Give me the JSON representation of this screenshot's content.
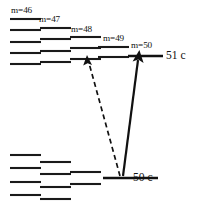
{
  "figure": {
    "type": "energy-level-diagram",
    "width": 197,
    "height": 206,
    "background": "#ffffff",
    "ink_color": "#111111"
  },
  "manifold_labels": [
    {
      "text": "m=46",
      "x": 11,
      "y": 6
    },
    {
      "text": "m=47",
      "x": 39,
      "y": 15
    },
    {
      "text": "m=48",
      "x": 71,
      "y": 25
    },
    {
      "text": "m=49",
      "x": 103,
      "y": 34
    },
    {
      "text": "m=50",
      "x": 131,
      "y": 41
    }
  ],
  "state_labels": [
    {
      "text": "51 c",
      "x": 160,
      "y": 52
    },
    {
      "text": "50 c",
      "x": 133,
      "y": 172
    }
  ],
  "upper_manifold": {
    "name": "n=51 manifold",
    "columns": [
      {
        "m": "m=46",
        "x1": 10,
        "x2": 41,
        "levels_y": [
          19,
          30,
          42,
          53,
          64
        ]
      },
      {
        "m": "m=47",
        "x1": 40,
        "x2": 71,
        "levels_y": [
          28,
          39,
          51,
          62
        ]
      },
      {
        "m": "m=48",
        "x1": 70,
        "x2": 101,
        "levels_y": [
          37,
          48,
          59
        ]
      },
      {
        "m": "m=49",
        "x1": 98,
        "x2": 129,
        "levels_y": [
          47,
          57
        ]
      },
      {
        "m": "m=50",
        "x1": 128,
        "x2": 163,
        "levels_y": [
          56
        ]
      }
    ]
  },
  "lower_manifold": {
    "name": "n=50 manifold",
    "columns": [
      {
        "m": "m=46",
        "x1": 10,
        "x2": 41,
        "levels_y": [
          155,
          168,
          182,
          195
        ]
      },
      {
        "m": "m=47",
        "x1": 40,
        "x2": 71,
        "levels_y": [
          162,
          174,
          187,
          199
        ]
      },
      {
        "m": "m=48",
        "x1": 70,
        "x2": 101,
        "levels_y": [
          172,
          184
        ]
      },
      {
        "m": "m=49",
        "x1": 98,
        "x2": 129,
        "levels_y": [
          179
        ]
      },
      {
        "m": "m=50",
        "x1": 103,
        "x2": 158,
        "levels_y": [
          178
        ]
      }
    ]
  },
  "transitions": [
    {
      "name": "dashed-transition",
      "style": "dashed",
      "from_x": 120,
      "from_y": 176,
      "to_x": 87,
      "to_y": 57
    },
    {
      "name": "solid-transition",
      "style": "solid",
      "from_x": 123,
      "from_y": 176,
      "to_x": 139,
      "to_y": 52
    }
  ]
}
